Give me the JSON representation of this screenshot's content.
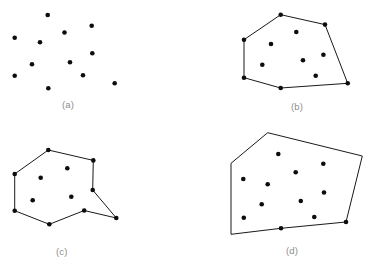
{
  "figure": {
    "background_color": "#ffffff",
    "point_color": "#0d0d0d",
    "edge_color": "#1a1a1a",
    "caption_color": "#8d8d8d",
    "point_radius": 2.3,
    "edge_width": 1.0,
    "width": 370,
    "height": 270
  },
  "captions": {
    "a": "(a)",
    "b": "(b)",
    "c": "(c)",
    "d": "(d)"
  },
  "chart_data": {
    "type": "scatter",
    "xlabel": "",
    "ylabel": "",
    "grid": false,
    "legend": "none",
    "xlim": [
      0,
      370
    ],
    "ylim": [
      270,
      0
    ],
    "panels": [
      {
        "id": "a",
        "label": "(a)",
        "caption_position": [
          62,
          99
        ],
        "description": "scattered point set with no polygon",
        "polygon": [],
        "points": [
          [
            47.7,
            15.0
          ],
          [
            91.7,
            25.7
          ],
          [
            64.5,
            32.5
          ],
          [
            14.7,
            37.7
          ],
          [
            40.0,
            42.3
          ],
          [
            92.3,
            53.3
          ],
          [
            70.0,
            62.3
          ],
          [
            32.0,
            64.3
          ],
          [
            83.0,
            75.3
          ],
          [
            14.7,
            75.7
          ],
          [
            114.7,
            83.3
          ],
          [
            48.3,
            88.3
          ]
        ]
      },
      {
        "id": "b",
        "label": "(b)",
        "caption_position": [
          291,
          101
        ],
        "description": "convex hull polygon enclosing the point set",
        "polygon": [
          [
            280.7,
            14.7
          ],
          [
            325.0,
            24.6
          ],
          [
            347.7,
            83.3
          ],
          [
            280.7,
            88.0
          ],
          [
            244.0,
            77.7
          ],
          [
            244.0,
            39.7
          ]
        ],
        "points": [
          [
            280.7,
            14.7
          ],
          [
            325.0,
            24.6
          ],
          [
            296.3,
            32.0
          ],
          [
            244.0,
            39.7
          ],
          [
            271.0,
            44.0
          ],
          [
            323.4,
            54.8
          ],
          [
            303.0,
            60.3
          ],
          [
            262.3,
            64.7
          ],
          [
            315.7,
            75.7
          ],
          [
            244.0,
            77.7
          ],
          [
            347.7,
            83.3
          ],
          [
            280.7,
            88.0
          ]
        ]
      },
      {
        "id": "c",
        "label": "(c)",
        "caption_position": [
          56,
          246
        ],
        "description": "non-convex simple polygon through the point set",
        "polygon": [
          [
            48.3,
            150.0
          ],
          [
            93.3,
            160.4
          ],
          [
            92.7,
            190.0
          ],
          [
            116.3,
            218.0
          ],
          [
            84.2,
            210.5
          ],
          [
            49.3,
            224.3
          ],
          [
            14.7,
            210.7
          ],
          [
            14.7,
            174.0
          ]
        ],
        "points": [
          [
            48.3,
            150.0
          ],
          [
            93.3,
            160.4
          ],
          [
            67.3,
            168.3
          ],
          [
            14.7,
            174.0
          ],
          [
            40.7,
            177.7
          ],
          [
            92.7,
            190.0
          ],
          [
            71.3,
            196.7
          ],
          [
            32.7,
            200.3
          ],
          [
            84.2,
            210.5
          ],
          [
            14.7,
            210.7
          ],
          [
            116.3,
            218.0
          ],
          [
            49.3,
            224.3
          ]
        ]
      },
      {
        "id": "d",
        "label": "(d)",
        "caption_position": [
          286,
          245
        ],
        "description": "large convex polygon enclosing all interior points",
        "polygon": [
          [
            267.7,
            132.7
          ],
          [
            362.3,
            156.0
          ],
          [
            346.0,
            222.0
          ],
          [
            281.0,
            228.3
          ],
          [
            231.0,
            234.3
          ],
          [
            231.0,
            163.3
          ]
        ],
        "points": [
          [
            278.3,
            154.0
          ],
          [
            323.3,
            163.8
          ],
          [
            295.7,
            172.3
          ],
          [
            243.3,
            179.0
          ],
          [
            267.7,
            184.3
          ],
          [
            324.0,
            192.5
          ],
          [
            300.8,
            201.0
          ],
          [
            261.7,
            204.2
          ],
          [
            314.3,
            217.0
          ],
          [
            243.8,
            217.8
          ],
          [
            346.0,
            222.0
          ],
          [
            281.0,
            228.3
          ]
        ]
      }
    ]
  }
}
